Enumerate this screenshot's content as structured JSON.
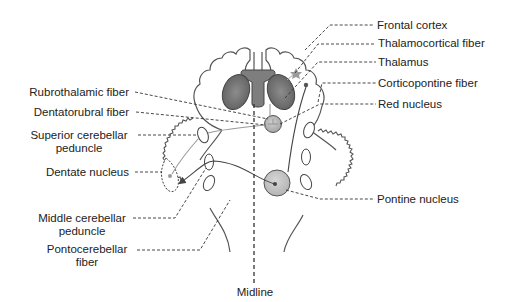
{
  "diagram": {
    "type": "anatomical-schematic",
    "labels_right": [
      {
        "id": "frontal-cortex",
        "text": "Frontal cortex"
      },
      {
        "id": "thalamocortical-fiber",
        "text": "Thalamocortical fiber"
      },
      {
        "id": "thalamus",
        "text": "Thalamus"
      },
      {
        "id": "corticopontine-fiber",
        "text": "Corticopontine fiber"
      },
      {
        "id": "red-nucleus",
        "text": "Red nucleus"
      },
      {
        "id": "pontine-nucleus",
        "text": "Pontine nucleus"
      }
    ],
    "labels_left": [
      {
        "id": "rubrothalamic-fiber",
        "line1": "Rubrothalamic fiber",
        "line2": ""
      },
      {
        "id": "dentatorubral-fiber",
        "line1": "Dentatorubral fiber",
        "line2": ""
      },
      {
        "id": "superior-cerebellar-peduncle",
        "line1": "Superior cerebellar",
        "line2": "peduncle"
      },
      {
        "id": "dentate-nucleus",
        "line1": "Dentate nucleus",
        "line2": ""
      },
      {
        "id": "middle-cerebellar-peduncle",
        "line1": "Middle cerebellar",
        "line2": "peduncle"
      },
      {
        "id": "pontocerebellar-fiber",
        "line1": "Pontocerebellar",
        "line2": "fiber"
      }
    ],
    "labels_bottom": [
      {
        "id": "midline",
        "text": "Midline"
      }
    ],
    "colors": {
      "outline": "#555555",
      "nucleus_fill": "#7a7a7a",
      "ventricle_fill": "#8a8a8a",
      "red_nucleus_fill": "#b5b5b5",
      "pontine_fill": "#c4c4c4",
      "leader_line": "#333333",
      "pathway_gray": "#9a9a9a",
      "pathway_dark": "#444444"
    }
  }
}
